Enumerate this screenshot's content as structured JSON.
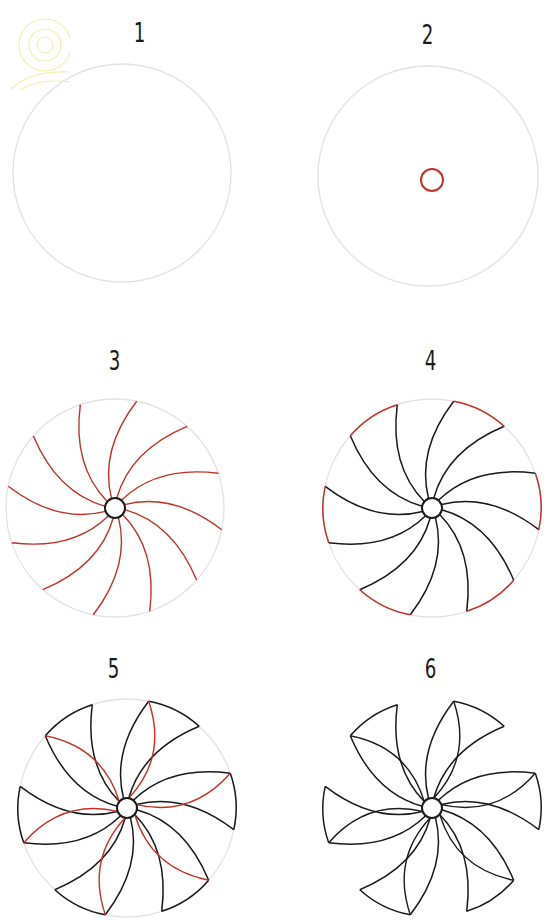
{
  "colors": {
    "guide_circle": "#e2e2e2",
    "new_stroke": "#c0322a",
    "ink": "#1a1a1a",
    "background": "#ffffff",
    "decor": "#f3efb0"
  },
  "steps": [
    {
      "number": "1",
      "description": "Draw a large light guide circle"
    },
    {
      "number": "2",
      "description": "Draw a small circle at the center"
    },
    {
      "number": "3",
      "description": "Draw 12 curved spokes from the center to the edge"
    },
    {
      "number": "4",
      "description": "Connect pairs of spokes with arcs along the edge"
    },
    {
      "number": "5",
      "description": "Draw curved inner folds on each petal"
    },
    {
      "number": "6",
      "description": "Erase guide lines to finish the flower"
    }
  ],
  "petal_count": 6,
  "spoke_count": 12
}
